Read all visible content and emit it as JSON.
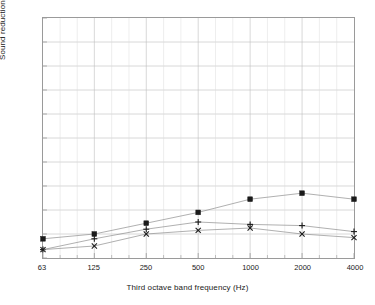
{
  "chart_data": {
    "type": "line",
    "title": "",
    "xlabel": "Third octave band frequency (Hz)",
    "ylabel": "Sound reduction index (dB)",
    "xscale": "log",
    "x": [
      63,
      125,
      250,
      500,
      1000,
      2000,
      4000
    ],
    "x_tick_labels": [
      "63",
      "125",
      "250",
      "500",
      "1000",
      "2000",
      "4000"
    ],
    "y_tick_labels": [
      "0",
      "10",
      "20",
      "30",
      "40",
      "50",
      "60",
      "70",
      "80",
      "90",
      "100"
    ],
    "y_ticks": [
      0,
      10,
      20,
      30,
      40,
      50,
      60,
      70,
      80,
      90,
      100
    ],
    "ylim": [
      0,
      100
    ],
    "grid": "on",
    "legend": "none",
    "minor_x_ticks_per_decade": 2,
    "series": [
      {
        "name": "series-square",
        "marker": "filled-square",
        "color": "#1a1a1a",
        "line_color": "#8c8c8c",
        "values": [
          8,
          10,
          14.5,
          19,
          24.5,
          27,
          24.5
        ]
      },
      {
        "name": "series-plus",
        "marker": "plus",
        "color": "#1a1a1a",
        "line_color": "#8c8c8c",
        "values": [
          3.5,
          8,
          12,
          15,
          14,
          13.5,
          11
        ]
      },
      {
        "name": "series-cross",
        "marker": "cross",
        "color": "#1a1a1a",
        "line_color": "#8c8c8c",
        "values": [
          3.5,
          5,
          10,
          11.5,
          12.5,
          10,
          8.5
        ]
      }
    ],
    "colors": {
      "background": "#ffffff",
      "frame": "#9a9a9a",
      "gridline_major": "#bdbdbd",
      "gridline_minor": "#dcdcdc",
      "marker": "#1a1a1a",
      "line": "#8c8c8c",
      "text": "#1a1a1a"
    }
  }
}
